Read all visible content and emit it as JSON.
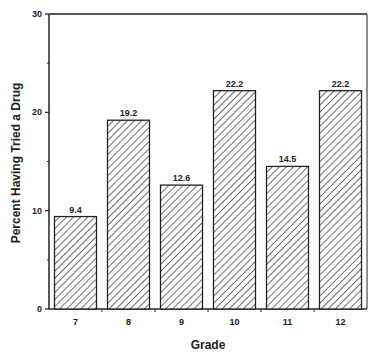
{
  "chart_data": {
    "type": "bar",
    "title": "",
    "xlabel": "Grade",
    "ylabel": "Percent Having Tried a Drug",
    "categories": [
      "7",
      "8",
      "9",
      "10",
      "11",
      "12"
    ],
    "values": [
      9.4,
      19.2,
      12.6,
      22.2,
      14.5,
      22.2
    ],
    "value_labels": [
      "9.4",
      "19.2",
      "12.6",
      "22.2",
      "14.5",
      "22.2"
    ],
    "ylim": [
      0,
      30
    ],
    "yticks": [
      "0",
      "10",
      "20",
      "30"
    ],
    "grid": false,
    "legend": null,
    "bar_fill": "diagonal-hatch",
    "colors": {
      "ink": "#222222",
      "background": "#ffffff"
    }
  }
}
